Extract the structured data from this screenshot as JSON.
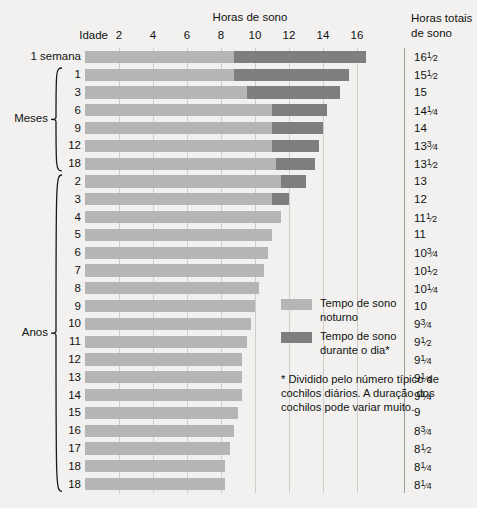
{
  "headers": {
    "hours_axis": "Horas de sono",
    "age_col": "Idade",
    "total_line1": "Horas totais",
    "total_line2": "de sono"
  },
  "groups": {
    "weeks_label": "1 semana",
    "months_label": "Meses",
    "years_label": "Anos"
  },
  "legend": {
    "night_label": "Tempo de sono noturno",
    "day_label": "Tempo de sono durante o dia*"
  },
  "footnote": {
    "text": "* Dividido pelo número típico de cochilos diários. A duração dos cochilos pode variar muito."
  },
  "chart_data": {
    "type": "bar",
    "title": "Horas de sono",
    "subtitle": "",
    "xlabel": "Horas de sono",
    "ylabel": "Idade",
    "xlim": [
      0,
      17
    ],
    "xticks": [
      2,
      4,
      6,
      8,
      10,
      12,
      14,
      16
    ],
    "grid": true,
    "orientation": "horizontal",
    "stacked": true,
    "legend_position": "inside-right",
    "colors": {
      "night": "#b5b5b5",
      "day": "#7e7e7e",
      "background": "#f2f1ef",
      "gridline": "#cfcdc9"
    },
    "series": [
      {
        "name": "Tempo de sono noturno",
        "values": [
          8.75,
          8.75,
          9.5,
          11.0,
          11.0,
          11.0,
          11.25,
          11.5,
          11.0,
          11.0,
          11.0,
          10.75,
          10.5,
          10.25,
          10.0,
          9.75,
          9.5,
          9.25,
          9.25,
          9.25,
          9.0,
          8.75,
          8.5,
          8.25,
          8.25
        ]
      },
      {
        "name": "Tempo de sono durante o dia*",
        "values": [
          7.75,
          6.75,
          5.5,
          3.25,
          3.0,
          2.75,
          2.25,
          1.5,
          1.0,
          0,
          0,
          0,
          0,
          0,
          0,
          0,
          0,
          0,
          0,
          0,
          0,
          0,
          0,
          0,
          0
        ]
      }
    ],
    "rows": [
      {
        "age": "1 semana",
        "group": "weeks",
        "night": 8.75,
        "day": 7.75,
        "total_text": "16",
        "total_frac_num": "1",
        "total_frac_den": "2",
        "total_value": 16.5
      },
      {
        "age": "1",
        "group": "months",
        "night": 8.75,
        "day": 6.75,
        "total_text": "15",
        "total_frac_num": "1",
        "total_frac_den": "2",
        "total_value": 15.5
      },
      {
        "age": "3",
        "group": "months",
        "night": 9.5,
        "day": 5.5,
        "total_text": "15",
        "total_frac_num": "",
        "total_frac_den": "",
        "total_value": 15
      },
      {
        "age": "6",
        "group": "months",
        "night": 11.0,
        "day": 3.25,
        "total_text": "14",
        "total_frac_num": "1",
        "total_frac_den": "4",
        "total_value": 14.25
      },
      {
        "age": "9",
        "group": "months",
        "night": 11.0,
        "day": 3.0,
        "total_text": "14",
        "total_frac_num": "",
        "total_frac_den": "",
        "total_value": 14
      },
      {
        "age": "12",
        "group": "months",
        "night": 11.0,
        "day": 2.75,
        "total_text": "13",
        "total_frac_num": "3",
        "total_frac_den": "4",
        "total_value": 13.75
      },
      {
        "age": "18",
        "group": "months",
        "night": 11.25,
        "day": 2.25,
        "total_text": "13",
        "total_frac_num": "1",
        "total_frac_den": "2",
        "total_value": 13.5
      },
      {
        "age": "2",
        "group": "years",
        "night": 11.5,
        "day": 1.5,
        "total_text": "13",
        "total_frac_num": "",
        "total_frac_den": "",
        "total_value": 13
      },
      {
        "age": "3",
        "group": "years",
        "night": 11.0,
        "day": 1.0,
        "total_text": "12",
        "total_frac_num": "",
        "total_frac_den": "",
        "total_value": 12
      },
      {
        "age": "4",
        "group": "years",
        "night": 11.5,
        "day": 0,
        "total_text": "11",
        "total_frac_num": "1",
        "total_frac_den": "2",
        "total_value": 11.5
      },
      {
        "age": "5",
        "group": "years",
        "night": 11.0,
        "day": 0,
        "total_text": "11",
        "total_frac_num": "",
        "total_frac_den": "",
        "total_value": 11
      },
      {
        "age": "6",
        "group": "years",
        "night": 10.75,
        "day": 0,
        "total_text": "10",
        "total_frac_num": "3",
        "total_frac_den": "4",
        "total_value": 10.75
      },
      {
        "age": "7",
        "group": "years",
        "night": 10.5,
        "day": 0,
        "total_text": "10",
        "total_frac_num": "1",
        "total_frac_den": "2",
        "total_value": 10.5
      },
      {
        "age": "8",
        "group": "years",
        "night": 10.25,
        "day": 0,
        "total_text": "10",
        "total_frac_num": "1",
        "total_frac_den": "4",
        "total_value": 10.25
      },
      {
        "age": "9",
        "group": "years",
        "night": 10.0,
        "day": 0,
        "total_text": "10",
        "total_frac_num": "",
        "total_frac_den": "",
        "total_value": 10
      },
      {
        "age": "10",
        "group": "years",
        "night": 9.75,
        "day": 0,
        "total_text": "9",
        "total_frac_num": "3",
        "total_frac_den": "4",
        "total_value": 9.75
      },
      {
        "age": "11",
        "group": "years",
        "night": 9.5,
        "day": 0,
        "total_text": "9",
        "total_frac_num": "1",
        "total_frac_den": "2",
        "total_value": 9.5
      },
      {
        "age": "12",
        "group": "years",
        "night": 9.25,
        "day": 0,
        "total_text": "9",
        "total_frac_num": "1",
        "total_frac_den": "4",
        "total_value": 9.25
      },
      {
        "age": "13",
        "group": "years",
        "night": 9.25,
        "day": 0,
        "total_text": "9",
        "total_frac_num": "1",
        "total_frac_den": "4",
        "total_value": 9.25
      },
      {
        "age": "14",
        "group": "years",
        "night": 9.25,
        "day": 0,
        "total_text": "9",
        "total_frac_num": "1",
        "total_frac_den": "4",
        "total_value": 9.25
      },
      {
        "age": "15",
        "group": "years",
        "night": 9.0,
        "day": 0,
        "total_text": "9",
        "total_frac_num": "",
        "total_frac_den": "",
        "total_value": 9
      },
      {
        "age": "16",
        "group": "years",
        "night": 8.75,
        "day": 0,
        "total_text": "8",
        "total_frac_num": "3",
        "total_frac_den": "4",
        "total_value": 8.75
      },
      {
        "age": "17",
        "group": "years",
        "night": 8.5,
        "day": 0,
        "total_text": "8",
        "total_frac_num": "1",
        "total_frac_den": "2",
        "total_value": 8.5
      },
      {
        "age": "18",
        "group": "years",
        "night": 8.25,
        "day": 0,
        "total_text": "8",
        "total_frac_num": "1",
        "total_frac_den": "4",
        "total_value": 8.25
      },
      {
        "age": "18 ",
        "group": "years",
        "night": 8.25,
        "day": 0,
        "total_text": "8",
        "total_frac_num": "1",
        "total_frac_den": "4",
        "total_value": 8.25
      }
    ]
  }
}
